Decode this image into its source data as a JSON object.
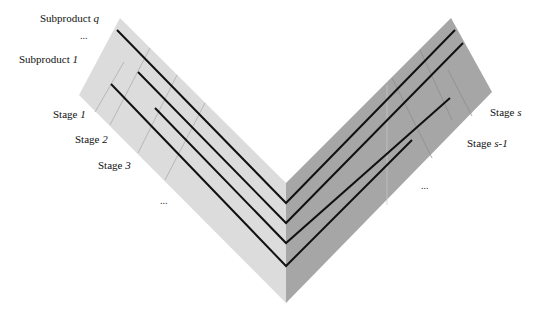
{
  "diagram": {
    "type": "v-shaped multi-stage process diagram",
    "colors": {
      "left_band": "#dcdcdc",
      "right_band": "#a6a6a6",
      "flow_line": "#111111",
      "divider": "#9a9a9a"
    },
    "left_labels": {
      "subproduct_q": {
        "prefix": "Subproduct ",
        "var": "q"
      },
      "subproduct_dots": "...",
      "subproduct_1": {
        "prefix": "Subproduct ",
        "var": "1"
      },
      "stage_1": {
        "prefix": "Stage ",
        "var": "1"
      },
      "stage_2": {
        "prefix": "Stage ",
        "var": "2"
      },
      "stage_3": {
        "prefix": "Stage ",
        "var": "3"
      },
      "stage_dots": "..."
    },
    "right_labels": {
      "stage_s": {
        "prefix": "Stage ",
        "var": "s"
      },
      "stage_s_minus_1": {
        "prefix": "Stage ",
        "var": "s-1"
      },
      "stage_dots": "..."
    },
    "flow_lines": [
      {
        "start": [
          117,
          30
        ],
        "vertex": [
          286,
          203
        ],
        "end": [
          455,
          30
        ]
      },
      {
        "start": [
          111,
          84
        ],
        "vertex": [
          286,
          266
        ],
        "end": [
          412,
          140
        ]
      },
      {
        "start": [
          138,
          72
        ],
        "vertex": [
          286,
          223
        ],
        "end": [
          463,
          43
        ]
      },
      {
        "start": [
          155,
          108
        ],
        "vertex": [
          286,
          243
        ],
        "end": [
          450,
          98
        ]
      }
    ]
  }
}
